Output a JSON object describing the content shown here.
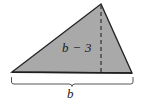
{
  "figure": {
    "type": "geometry-diagram",
    "shape": "triangle",
    "labels": {
      "altitude": "b − 3",
      "base": "b"
    },
    "colors": {
      "background": "#ffffff",
      "fill": "#a9a9a9",
      "outline": "#262626",
      "dashed_line": "#3a3a3a",
      "brace": "#555555",
      "text": "#1a1a1a"
    },
    "geometry": {
      "apex": [
        101,
        4
      ],
      "bottom_left": [
        12,
        72
      ],
      "bottom_right": [
        132,
        73
      ],
      "altitude_x": 101,
      "altitude_top_y": 4,
      "altitude_bottom_y": 72,
      "brace_left_x": 11,
      "brace_right_x": 133,
      "brace_y": 78,
      "brace_center_x": 72
    }
  }
}
